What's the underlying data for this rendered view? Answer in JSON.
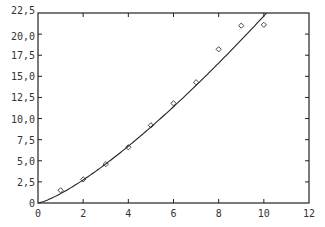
{
  "chart_data": {
    "type": "scatter",
    "title": "",
    "xlabel": "",
    "ylabel": "",
    "xlim": [
      0,
      12
    ],
    "ylim": [
      0,
      225
    ],
    "grid": false,
    "legend": "none",
    "x_ticks": [
      0,
      2,
      4,
      6,
      8,
      10,
      12
    ],
    "x_tick_labels": [
      "0",
      "2",
      "4",
      "6",
      "8",
      "10",
      "12"
    ],
    "y_ticks": [
      0,
      25,
      50,
      75,
      100,
      125,
      150,
      175,
      200,
      225
    ],
    "y_tick_labels": [
      "0",
      "2,5",
      "5,0",
      "7,5",
      "10,0",
      "12,5",
      "15,0",
      "17,5",
      "20,0",
      "22,5"
    ],
    "series": [
      {
        "name": "observations",
        "kind": "scatter",
        "marker": "diamond",
        "x": [
          1,
          2,
          3,
          4,
          5,
          6,
          7,
          8,
          9,
          10
        ],
        "y": [
          15,
          28,
          46,
          66,
          92,
          118,
          143,
          182,
          210,
          211
        ]
      },
      {
        "name": "fitted curve",
        "kind": "line",
        "model": "y = 11.1 * x^1.3",
        "coefficients": {
          "a": 11.1,
          "b": 1.3
        },
        "x_range": [
          0,
          10.2
        ]
      }
    ],
    "color": "#222222"
  }
}
